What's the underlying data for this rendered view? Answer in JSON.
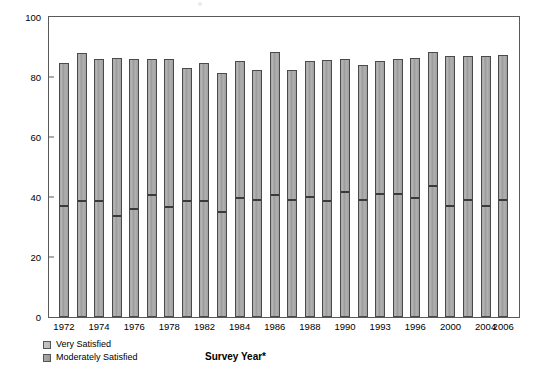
{
  "chart_data": {
    "type": "bar",
    "subtype": "stacked-bar",
    "title": "",
    "xlabel": "Survey Year*",
    "ylabel": "Percent Satisfied",
    "ylim": [
      0,
      100
    ],
    "yticks": [
      0,
      20,
      40,
      60,
      80,
      100
    ],
    "grid": false,
    "legend_position": "bottom-left",
    "categories": [
      "1972",
      "1973",
      "1974",
      "1975",
      "1976",
      "1977",
      "1978",
      "1980",
      "1982",
      "1983",
      "1984",
      "1985",
      "1986",
      "1987",
      "1988",
      "1989",
      "1990",
      "1991",
      "1993",
      "1994",
      "1996",
      "1998",
      "2000",
      "2002",
      "2004",
      "2006"
    ],
    "xtick_labels": [
      "1972",
      "1974",
      "1976",
      "1978",
      "1982",
      "1984",
      "1986",
      "1988",
      "1990",
      "1993",
      "1996",
      "2000",
      "2004",
      "2006"
    ],
    "series": [
      {
        "name": "Very Satisfied",
        "color": "#bcbcbc",
        "values": [
          36.5,
          38.0,
          38.0,
          33.0,
          35.5,
          40.0,
          36.0,
          38.0,
          38.0,
          34.5,
          39.0,
          38.5,
          40.0,
          38.5,
          39.5,
          38.0,
          41.0,
          38.5,
          40.5,
          40.5,
          39.0,
          43.0,
          36.5,
          38.5,
          36.5,
          38.5
        ]
      },
      {
        "name": "Moderately Satisfied",
        "color": "#a0a0a0",
        "values": [
          48.3,
          50.0,
          47.9,
          53.5,
          50.5,
          46.0,
          50.0,
          45.0,
          46.8,
          46.8,
          46.5,
          44.0,
          48.5,
          43.8,
          45.8,
          47.7,
          45.0,
          45.6,
          44.8,
          45.5,
          47.5,
          45.5,
          50.5,
          48.5,
          50.5,
          49.0
        ]
      }
    ],
    "totals": [
      84.8,
      88.0,
      85.9,
      86.5,
      86.0,
      86.0,
      86.0,
      83.0,
      84.8,
      81.3,
      85.5,
      82.5,
      88.5,
      82.3,
      85.3,
      85.7,
      86.0,
      84.1,
      85.3,
      86.0,
      86.5,
      88.5,
      87.0,
      87.0,
      87.0,
      87.5
    ]
  },
  "axes": {
    "y_title": "Percent Satisfied",
    "x_title": "Survey Year*"
  },
  "legend": {
    "items": [
      {
        "label": "Very Satisfied"
      },
      {
        "label": "Moderately Satisfied"
      }
    ]
  },
  "colors": {
    "bar_fill": "#a8a8a8",
    "bar_border": "#4a4a4a",
    "divider": "#3a3a3a",
    "axis": "#5a5a5a",
    "text": "#000000"
  }
}
